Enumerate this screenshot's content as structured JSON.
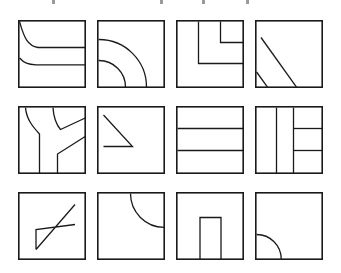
{
  "sheet": {
    "title": "Abstract line figure grid",
    "background_color": "#ffffff",
    "ink_color": "#1a1a1a",
    "columns": 4,
    "rows": 3,
    "tile_count": 12,
    "tile_size_px": 68
  },
  "crop_marks": {
    "color": "#9a9a9a",
    "positions_px": [
      52,
      160,
      202,
      246
    ]
  },
  "tiles": [
    {
      "index": 1,
      "position": "row-1-col-1",
      "name": "curve-and-two-horizontal-bands",
      "description": "Square with a curve falling from the top-left corner that flattens into a horizontal line crossing to the right edge, plus a second flattening curve lower down crossing to the right edge."
    },
    {
      "index": 2,
      "position": "row-1-col-2",
      "name": "two-concentric-quarter-arcs",
      "description": "Square containing two concentric quarter-circle arcs centred on the bottom-left corner."
    },
    {
      "index": 3,
      "position": "row-1-col-3",
      "name": "nested-right-angle-steps",
      "description": "Square with two nested right-angle step paths: a vertical dropping from the top edge turning right to the right edge, and a shorter inner one above it."
    },
    {
      "index": 4,
      "position": "row-1-col-4",
      "name": "two-parallel-diagonals",
      "description": "Square with a long diagonal from upper-left to lower-right and a short parallel diagonal near the lower-left corner."
    },
    {
      "index": 5,
      "position": "row-2-col-1",
      "name": "curve-vertical-and-branching-y",
      "description": "Square with a curve from the top edge bending into a vertical line down to the bottom, and a branching Y form on the right with two diagonals reaching the right edge."
    },
    {
      "index": 6,
      "position": "row-2-col-2",
      "name": "right-triangle-open-left",
      "description": "Square with a diagonal from the upper-left down to mid-height and a horizontal base running back to the left edge, forming a right triangle."
    },
    {
      "index": 7,
      "position": "row-2-col-3",
      "name": "three-horizontal-bands",
      "description": "Square divided by two full-width horizontal lines into three horizontal bands."
    },
    {
      "index": 8,
      "position": "row-2-col-4",
      "name": "vertical-line-and-bracket-stubs",
      "description": "Square with a full-height vertical line at left-third and a second vertical at mid-width carrying two horizontal stubs that run right to the right edge."
    },
    {
      "index": 9,
      "position": "row-3-col-1",
      "name": "diagonal-parallelogram-band",
      "description": "Square containing a long parallelogram band made of two parallel diagonals from lower-left to upper-right closed by a short vertical at the left end."
    },
    {
      "index": 10,
      "position": "row-3-col-2",
      "name": "quarter-arc-top-right",
      "description": "Square with one quarter-circle arc centred on the top-right corner sweeping from the top edge to the right edge."
    },
    {
      "index": 11,
      "position": "row-3-col-3",
      "name": "inverted-u-doorway",
      "description": "Square with an inverted-U doorway shape rising from the bottom edge: two short verticals joined by a horizontal top."
    },
    {
      "index": 12,
      "position": "row-3-col-4",
      "name": "quarter-arc-bottom-left",
      "description": "Square with one quarter-circle arc centred on the bottom-left corner sweeping from the left edge to the bottom edge."
    }
  ]
}
